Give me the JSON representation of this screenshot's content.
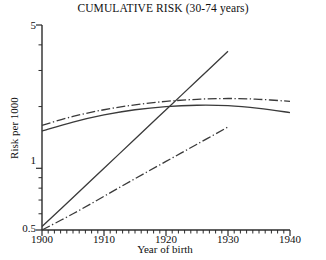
{
  "chart_data": {
    "type": "line",
    "title": "CUMULATIVE RISK (30-74 years)",
    "xlabel": "Year of birth",
    "ylabel": "Risk per 1000",
    "yscale": "log",
    "xlim": [
      1900,
      1940
    ],
    "ylim": [
      0.5,
      5
    ],
    "grid": false,
    "legend": "none",
    "xticks": [
      1900,
      1910,
      1920,
      1930,
      1940
    ],
    "xtick_labels": [
      "1900",
      "1910",
      "1920",
      "1930",
      "1940"
    ],
    "xminor_step": 1,
    "yticks": [
      0.5,
      1,
      5
    ],
    "ytick_labels": [
      "0.5",
      "1",
      "5"
    ],
    "yminor_ticks": [
      0.6,
      0.7,
      0.8,
      0.9,
      2,
      3,
      4
    ],
    "series": [
      {
        "name": "plateau-solid",
        "style": "solid",
        "x": [
          1900,
          1905,
          1910,
          1915,
          1920,
          1925,
          1930,
          1935,
          1940
        ],
        "y": [
          1.52,
          1.68,
          1.82,
          1.93,
          2.0,
          2.03,
          2.02,
          1.96,
          1.87
        ]
      },
      {
        "name": "plateau-dashdot",
        "style": "dash-dot",
        "x": [
          1900,
          1905,
          1910,
          1915,
          1920,
          1925,
          1930,
          1935,
          1940
        ],
        "y": [
          1.62,
          1.79,
          1.93,
          2.04,
          2.12,
          2.17,
          2.19,
          2.17,
          2.12
        ]
      },
      {
        "name": "rising-solid",
        "style": "solid",
        "x": [
          1900,
          1905,
          1910,
          1915,
          1920,
          1925,
          1930
        ],
        "y": [
          0.52,
          0.72,
          1.0,
          1.39,
          1.93,
          2.68,
          3.72
        ]
      },
      {
        "name": "rising-dashdot",
        "style": "dash-dot",
        "x": [
          1900,
          1905,
          1910,
          1915,
          1920,
          1925,
          1930
        ],
        "y": [
          0.5,
          0.6,
          0.73,
          0.89,
          1.08,
          1.31,
          1.59
        ]
      }
    ]
  },
  "axes": {
    "title": "CUMULATIVE RISK (30-74 years)",
    "x_axis_label": "Year of birth",
    "y_axis_label": "Risk per 1000",
    "x_tick_labels": [
      "1900",
      "1910",
      "1920",
      "1930",
      "1940"
    ],
    "y_tick_labels": [
      "5",
      "1",
      "0.5"
    ]
  },
  "colors": {
    "line": "#3a3a3a",
    "axis": "#2b2b2b",
    "text": "#101010",
    "background": "#ffffff"
  }
}
